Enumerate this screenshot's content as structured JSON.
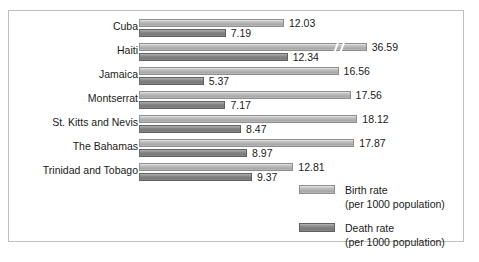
{
  "chart_data": {
    "type": "bar",
    "orientation": "horizontal",
    "title": "",
    "xlabel": "",
    "ylabel": "",
    "grid": false,
    "legend_position": "bottom-right",
    "axis_break": {
      "series": "Birth rate",
      "category": "Haiti",
      "note": "bar truncated with double-slash break mark"
    },
    "xlim": [
      0,
      19
    ],
    "categories": [
      "Cuba",
      "Haiti",
      "Jamaica",
      "Montserrat",
      "St. Kitts and Nevis",
      "The Bahamas",
      "Trinidad and Tobago"
    ],
    "series": [
      {
        "name": "Birth rate",
        "unit": "per 1000 population",
        "color": "#b6b6b6",
        "values": [
          12.03,
          36.59,
          16.56,
          17.56,
          18.12,
          17.87,
          12.81
        ]
      },
      {
        "name": "Death rate",
        "unit": "per 1000 population",
        "color": "#848484",
        "values": [
          7.19,
          12.34,
          5.37,
          7.17,
          8.47,
          8.97,
          9.37
        ]
      }
    ]
  },
  "legend": {
    "items": [
      {
        "label": "Birth rate",
        "sub": "(per 1000 population)"
      },
      {
        "label": "Death rate",
        "sub": "(per 1000 population)"
      }
    ]
  },
  "rows": [
    {
      "label": "Cuba",
      "birth": "12.03",
      "death": "7.19"
    },
    {
      "label": "Haiti",
      "birth": "36.59",
      "death": "12.34"
    },
    {
      "label": "Jamaica",
      "birth": "16.56",
      "death": "5.37"
    },
    {
      "label": "Montserrat",
      "birth": "17.56",
      "death": "7.17"
    },
    {
      "label": "St. Kitts and Nevis",
      "birth": "18.12",
      "death": "8.47"
    },
    {
      "label": "The Bahamas",
      "birth": "17.87",
      "death": "8.97"
    },
    {
      "label": "Trinidad and Tobago",
      "birth": "12.81",
      "death": "9.37"
    }
  ]
}
